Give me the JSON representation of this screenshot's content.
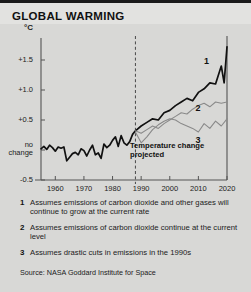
{
  "title": "GLOBAL WARMING",
  "annotation": "Temperature change projected",
  "source": "Source: NASA Goddard Institute for Space",
  "notes": [
    {
      "num": "1",
      "text": "Assumes emissions of carbon dioxide and other gases will continue to grow at the current rate"
    },
    {
      "num": "2",
      "text": "Assumes emissions of carbon dioxide continue at the current level"
    },
    {
      "num": "3",
      "text": "Assumes drastic cuts in emissions in the 1990s"
    }
  ],
  "colors": {
    "background": "#d8d8d6",
    "title_band": "#e2e2e0",
    "axis": "#555555",
    "series1": "#111111",
    "series2": "#8a8a8a",
    "series3": "#8a8a8a",
    "text": "#1b1b1b"
  },
  "chart_data": {
    "type": "line",
    "title": "GLOBAL WARMING",
    "xlabel": "",
    "ylabel": "°C",
    "xlim": [
      1955,
      2020
    ],
    "ylim": [
      -0.5,
      1.8
    ],
    "grid": false,
    "legend": "inline-series-numbers",
    "xticks": [
      1960,
      1970,
      1980,
      1990,
      2000,
      2010,
      2020
    ],
    "xtick_labels": [
      "1960",
      "1970",
      "1980",
      "1990",
      "2000",
      "2010",
      "2020"
    ],
    "yticks": [
      -0.5,
      0.0,
      0.5,
      1.0,
      1.5
    ],
    "ytick_labels": [
      "-0.5",
      "no change",
      "+0.5",
      "+1.0",
      "+1.5"
    ],
    "axis_unit_label": "°C",
    "projection_divider_x": 1988,
    "annotations": [
      {
        "text": "Temperature change projected",
        "x": 1989,
        "y": 0.33
      }
    ],
    "series": [
      {
        "name": "1",
        "label": "Assumes emissions of carbon dioxide and other gases will continue to grow at the current rate",
        "color": "#111111",
        "type": "historical+projected",
        "x": [
          1955,
          1956,
          1957,
          1958,
          1959,
          1960,
          1961,
          1962,
          1963,
          1964,
          1965,
          1966,
          1967,
          1968,
          1969,
          1970,
          1971,
          1972,
          1973,
          1974,
          1975,
          1976,
          1977,
          1978,
          1979,
          1980,
          1981,
          1982,
          1983,
          1984,
          1985,
          1986,
          1987,
          1988,
          1990,
          1992,
          1994,
          1996,
          1998,
          2000,
          2002,
          2004,
          2006,
          2008,
          2010,
          2012,
          2014,
          2016,
          2018,
          2019,
          2020
        ],
        "y": [
          0.02,
          0.06,
          0.01,
          0.08,
          0.04,
          -0.02,
          0.05,
          0.03,
          0.05,
          -0.18,
          -0.12,
          -0.06,
          -0.04,
          -0.08,
          0.02,
          -0.01,
          -0.1,
          0.0,
          0.08,
          -0.08,
          -0.05,
          -0.14,
          0.1,
          0.04,
          0.08,
          0.16,
          0.22,
          0.06,
          0.24,
          0.12,
          0.08,
          0.14,
          0.26,
          0.32,
          0.4,
          0.46,
          0.52,
          0.5,
          0.62,
          0.66,
          0.74,
          0.8,
          0.86,
          0.82,
          0.96,
          1.02,
          1.12,
          1.1,
          1.4,
          1.12,
          1.72
        ],
        "label_at": {
          "x": 2012,
          "y": 1.48
        }
      },
      {
        "name": "2",
        "label": "Assumes emissions of carbon dioxide continue at the current level",
        "color": "#8a8a8a",
        "type": "projected",
        "x": [
          1988,
          1990,
          1992,
          1994,
          1996,
          1998,
          2000,
          2002,
          2004,
          2006,
          2008,
          2010,
          2012,
          2014,
          2016,
          2018,
          2020
        ],
        "y": [
          0.32,
          0.28,
          0.34,
          0.4,
          0.36,
          0.44,
          0.5,
          0.56,
          0.62,
          0.6,
          0.68,
          0.74,
          0.78,
          0.72,
          0.8,
          0.78,
          0.8
        ],
        "label_at": {
          "x": 2009,
          "y": 0.7
        }
      },
      {
        "name": "3",
        "label": "Assumes drastic cuts in emissions in the 1990s",
        "color": "#8a8a8a",
        "type": "projected",
        "x": [
          1988,
          1990,
          1992,
          1994,
          1996,
          1998,
          2000,
          2002,
          2004,
          2006,
          2008,
          2010,
          2012,
          2014,
          2016,
          2018,
          2020
        ],
        "y": [
          0.3,
          0.12,
          0.22,
          0.34,
          0.42,
          0.48,
          0.52,
          0.5,
          0.44,
          0.4,
          0.36,
          0.3,
          0.44,
          0.36,
          0.48,
          0.4,
          0.52
        ],
        "label_at": {
          "x": 2009,
          "y": 0.16
        }
      }
    ]
  }
}
